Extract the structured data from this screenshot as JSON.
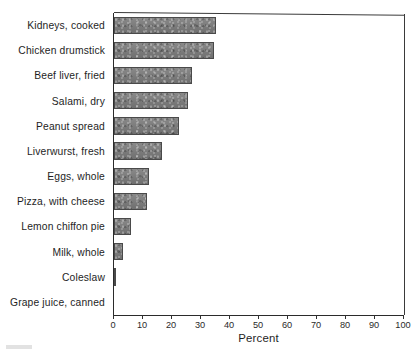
{
  "chart_data": {
    "type": "bar",
    "orientation": "horizontal",
    "title": "",
    "xlabel": "Percent",
    "ylabel": "",
    "xlim": [
      0,
      100
    ],
    "xticks": [
      0,
      10,
      20,
      30,
      40,
      50,
      60,
      70,
      80,
      90,
      100
    ],
    "xtick_labels": [
      "0",
      "10",
      "20",
      "30",
      "40",
      "50",
      "60",
      "70",
      "80",
      "90",
      "100"
    ],
    "grid": false,
    "legend": false,
    "bar_color": "#7c7c7c",
    "bar_edge_color": "#4a4a4a",
    "categories": [
      "Kidneys, cooked",
      "Chicken drumstick",
      "Beef liver, fried",
      "Salami, dry",
      "Peanut spread",
      "Liverwurst, fresh",
      "Eggs, whole",
      "Pizza, with cheese",
      "Lemon chiffon pie",
      "Milk, whole",
      "Coleslaw",
      "Grape juice, canned"
    ],
    "values": [
      35,
      34.5,
      27,
      25.5,
      22.5,
      16.5,
      12,
      11.5,
      6,
      3,
      0.8,
      0.1
    ]
  }
}
